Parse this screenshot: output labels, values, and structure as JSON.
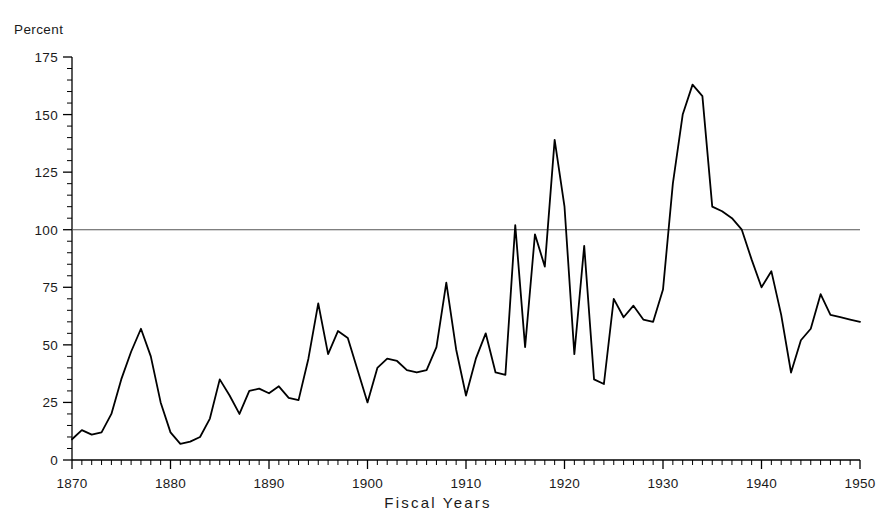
{
  "chart_data": {
    "type": "line",
    "title": "",
    "xlabel": "Fiscal Years",
    "ylabel": "Percent",
    "ylabel_position": "top-left",
    "xlim": [
      1870,
      1950
    ],
    "ylim": [
      0,
      175
    ],
    "ytick_step": 25,
    "yticks": [
      0,
      25,
      50,
      75,
      100,
      125,
      150,
      175
    ],
    "ytick_labels": [
      "0",
      "25",
      "50",
      "75",
      "100",
      "125",
      "150",
      "175"
    ],
    "y_minor_tick_step": 5,
    "xticks": [
      1870,
      1880,
      1890,
      1900,
      1910,
      1920,
      1930,
      1940,
      1950
    ],
    "xtick_labels": [
      "1870",
      "1880",
      "1890",
      "1900",
      "1910",
      "1920",
      "1930",
      "1940",
      "1950"
    ],
    "x_minor_tick_step": 1,
    "grid": false,
    "legend": false,
    "line_color": "#000000",
    "axis_color": "#000000",
    "background_color": "#ffffff",
    "reference_lines": [
      {
        "name": "hundred-percent-line",
        "orientation": "horizontal",
        "value": 100,
        "color": "#555555",
        "label": ""
      }
    ],
    "x": [
      1870,
      1871,
      1872,
      1873,
      1874,
      1875,
      1876,
      1877,
      1878,
      1879,
      1880,
      1881,
      1882,
      1883,
      1884,
      1885,
      1886,
      1887,
      1888,
      1889,
      1890,
      1891,
      1892,
      1893,
      1894,
      1895,
      1896,
      1897,
      1898,
      1899,
      1900,
      1901,
      1902,
      1903,
      1904,
      1905,
      1906,
      1907,
      1908,
      1909,
      1910,
      1911,
      1912,
      1913,
      1914,
      1915,
      1916,
      1917,
      1918,
      1919,
      1920,
      1921,
      1922,
      1923,
      1924,
      1925,
      1926,
      1927,
      1928,
      1929,
      1930,
      1931,
      1932,
      1933,
      1934,
      1935,
      1936,
      1937,
      1938,
      1939,
      1940,
      1941,
      1942,
      1943,
      1944,
      1945,
      1946,
      1947,
      1948,
      1949,
      1950
    ],
    "values": [
      9,
      13,
      11,
      12,
      20,
      35,
      47,
      57,
      45,
      25,
      12,
      7,
      8,
      10,
      18,
      35,
      28,
      20,
      30,
      31,
      29,
      32,
      27,
      26,
      44,
      68,
      46,
      56,
      53,
      39,
      25,
      40,
      44,
      43,
      39,
      38,
      39,
      49,
      77,
      48,
      28,
      44,
      55,
      38,
      37,
      102,
      49,
      98,
      84,
      139,
      110,
      46,
      93,
      35,
      33,
      70,
      62,
      67,
      61,
      60,
      74,
      120,
      150,
      163,
      158,
      110,
      108,
      105,
      100,
      87,
      75,
      82,
      63,
      38,
      52,
      57,
      72,
      63,
      62,
      61,
      60
    ],
    "series_name": "Percent",
    "annotations": []
  },
  "axis_labels": {
    "percent": "Percent",
    "fiscal_years": "Fiscal Years"
  }
}
